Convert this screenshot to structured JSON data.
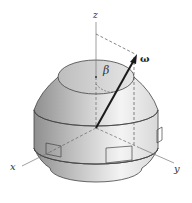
{
  "figure": {
    "type": "spacecraft rigid body with body-fixed axes",
    "labels": {
      "z_axis": "z",
      "x_axis": "x",
      "y_axis": "y",
      "angular_velocity": "ω",
      "angle": "β"
    },
    "colors": {
      "background": "#ffffff",
      "body_dark": "#9a9a9a",
      "body_light": "#f2f2f2",
      "top_face": "#d6d6d6",
      "outline": "#444444",
      "arrow": "#1a1a1a",
      "dashed": "#555555"
    }
  }
}
